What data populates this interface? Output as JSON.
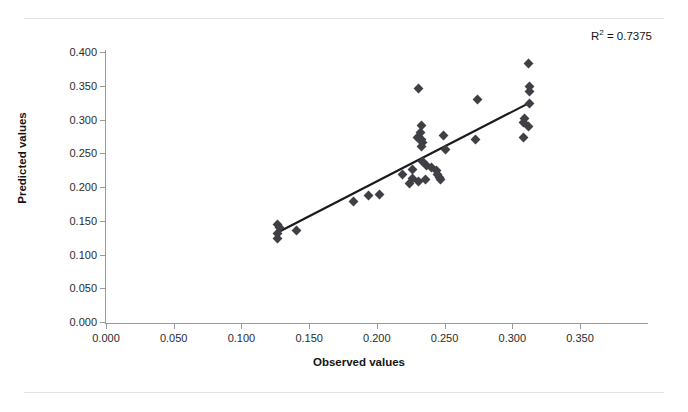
{
  "chart_data": {
    "type": "scatter",
    "title": "",
    "xlabel": "Observed values",
    "ylabel": "Predicted values",
    "xlim": [
      0.0,
      0.35
    ],
    "ylim": [
      0.0,
      0.4
    ],
    "xticks": [
      "0.000",
      "0.050",
      "0.100",
      "0.150",
      "0.200",
      "0.250",
      "0.300",
      "0.350"
    ],
    "xtick_values": [
      0.0,
      0.05,
      0.1,
      0.15,
      0.2,
      0.25,
      0.3,
      0.35
    ],
    "yticks": [
      "0.000",
      "0.050",
      "0.100",
      "0.150",
      "0.200",
      "0.250",
      "0.300",
      "0.350",
      "0.400"
    ],
    "ytick_values": [
      0.0,
      0.05,
      0.1,
      0.15,
      0.2,
      0.25,
      0.3,
      0.35,
      0.4
    ],
    "grid": false,
    "legend": "none",
    "annotation": "R² = 0.7375",
    "r_squared": 0.7375,
    "marker": "diamond",
    "marker_color": "#3f3f46",
    "trendline_color": "#1a1a1a",
    "trendline": {
      "x": [
        0.126,
        0.313
      ],
      "y": [
        0.132,
        0.325
      ]
    },
    "points": [
      {
        "x": 0.127,
        "y": 0.145
      },
      {
        "x": 0.128,
        "y": 0.14
      },
      {
        "x": 0.127,
        "y": 0.131
      },
      {
        "x": 0.127,
        "y": 0.124
      },
      {
        "x": 0.141,
        "y": 0.136
      },
      {
        "x": 0.183,
        "y": 0.179
      },
      {
        "x": 0.194,
        "y": 0.188
      },
      {
        "x": 0.202,
        "y": 0.189
      },
      {
        "x": 0.219,
        "y": 0.219
      },
      {
        "x": 0.226,
        "y": 0.226
      },
      {
        "x": 0.226,
        "y": 0.212
      },
      {
        "x": 0.224,
        "y": 0.205
      },
      {
        "x": 0.231,
        "y": 0.346
      },
      {
        "x": 0.233,
        "y": 0.291
      },
      {
        "x": 0.232,
        "y": 0.281
      },
      {
        "x": 0.23,
        "y": 0.273
      },
      {
        "x": 0.233,
        "y": 0.271
      },
      {
        "x": 0.234,
        "y": 0.266
      },
      {
        "x": 0.233,
        "y": 0.26
      },
      {
        "x": 0.234,
        "y": 0.238
      },
      {
        "x": 0.237,
        "y": 0.232
      },
      {
        "x": 0.231,
        "y": 0.208
      },
      {
        "x": 0.236,
        "y": 0.211
      },
      {
        "x": 0.24,
        "y": 0.229
      },
      {
        "x": 0.244,
        "y": 0.225
      },
      {
        "x": 0.245,
        "y": 0.219
      },
      {
        "x": 0.246,
        "y": 0.214
      },
      {
        "x": 0.247,
        "y": 0.211
      },
      {
        "x": 0.249,
        "y": 0.276
      },
      {
        "x": 0.251,
        "y": 0.256
      },
      {
        "x": 0.274,
        "y": 0.33
      },
      {
        "x": 0.273,
        "y": 0.271
      },
      {
        "x": 0.309,
        "y": 0.302
      },
      {
        "x": 0.308,
        "y": 0.295
      },
      {
        "x": 0.308,
        "y": 0.274
      },
      {
        "x": 0.312,
        "y": 0.383
      },
      {
        "x": 0.313,
        "y": 0.349
      },
      {
        "x": 0.313,
        "y": 0.342
      },
      {
        "x": 0.313,
        "y": 0.324
      },
      {
        "x": 0.312,
        "y": 0.29
      }
    ]
  }
}
